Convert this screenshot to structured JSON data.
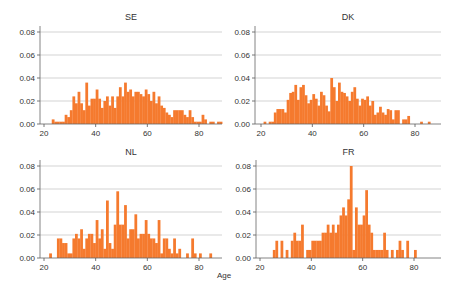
{
  "chart_data": {
    "type": "bar",
    "layout": "2x2 histogram grid",
    "xlabel": "Age",
    "ylabel": "",
    "xlim": [
      18,
      90
    ],
    "ylim": [
      0,
      0.085
    ],
    "x_ticks": [
      20,
      40,
      60,
      80
    ],
    "y_ticks": [
      "0.00",
      "0.02",
      "0.04",
      "0.06",
      "0.08"
    ],
    "grid": "horizontal",
    "bar_color": "#F57A2E",
    "bin_width": 1,
    "bin_start": 20,
    "panels": [
      {
        "title": "SE",
        "values": [
          0,
          0,
          0,
          0.004,
          0.002,
          0.002,
          0.002,
          0.002,
          0.008,
          0.006,
          0.012,
          0.024,
          0.018,
          0.028,
          0.018,
          0.012,
          0.036,
          0.016,
          0.022,
          0.022,
          0.03,
          0.022,
          0.014,
          0.02,
          0.024,
          0.016,
          0.024,
          0.014,
          0.024,
          0.032,
          0.024,
          0.036,
          0.028,
          0.03,
          0.024,
          0.028,
          0.028,
          0.026,
          0.024,
          0.03,
          0.026,
          0.02,
          0.028,
          0.018,
          0.024,
          0.016,
          0.014,
          0.01,
          0.008,
          0.006,
          0.012,
          0.012,
          0.012,
          0.012,
          0.008,
          0.006,
          0.012,
          0.006,
          0.002,
          0.002,
          0.002,
          0.008,
          0.004,
          0.0,
          0.002,
          0.002,
          0.0,
          0.002,
          0.002,
          0.0
        ]
      },
      {
        "title": "DK",
        "values": [
          0,
          0.002,
          0,
          0.002,
          0.002,
          0.01,
          0.013,
          0.013,
          0.013,
          0.01,
          0.021,
          0.027,
          0.028,
          0.034,
          0.021,
          0.032,
          0.034,
          0.025,
          0.018,
          0.021,
          0.026,
          0.022,
          0.016,
          0.028,
          0.025,
          0.016,
          0.011,
          0.04,
          0.032,
          0.02,
          0.036,
          0.028,
          0.027,
          0.024,
          0.02,
          0.028,
          0.032,
          0.022,
          0.016,
          0.022,
          0.021,
          0.024,
          0.016,
          0.02,
          0.008,
          0.01,
          0.015,
          0.01,
          0.008,
          0.013,
          0.012,
          0.004,
          0.012,
          0.012,
          0.0,
          0.004,
          0.004,
          0.007,
          0.0,
          0.0,
          0.0,
          0.0,
          0.002,
          0.0,
          0.0,
          0.002,
          0.0,
          0.0,
          0.0,
          0.0
        ]
      },
      {
        "title": "NL",
        "values": [
          0,
          0,
          0.004,
          0,
          0,
          0.017,
          0.017,
          0.013,
          0.013,
          0.004,
          0.004,
          0.017,
          0.021,
          0.017,
          0.025,
          0.008,
          0.017,
          0.021,
          0.021,
          0.013,
          0.033,
          0.017,
          0.025,
          0.008,
          0.05,
          0.013,
          0.008,
          0.029,
          0.058,
          0.029,
          0.029,
          0.046,
          0.017,
          0.025,
          0.025,
          0.038,
          0.017,
          0.021,
          0.021,
          0.033,
          0.021,
          0.017,
          0.017,
          0.013,
          0.033,
          0.004,
          0.017,
          0.017,
          0.008,
          0.004,
          0.017,
          0.004,
          0.008,
          0.0,
          0.0,
          0.004,
          0.0,
          0.017,
          0.004,
          0.0,
          0.004,
          0.0,
          0.0,
          0.0,
          0.004,
          0,
          0,
          0,
          0,
          0
        ]
      },
      {
        "title": "FR",
        "values": [
          0,
          0,
          0,
          0,
          0,
          0.007,
          0.015,
          0,
          0.015,
          0,
          0.007,
          0,
          0.015,
          0.022,
          0.015,
          0.015,
          0.029,
          0,
          0.007,
          0.007,
          0.015,
          0.015,
          0.015,
          0.015,
          0.022,
          0.022,
          0.029,
          0.022,
          0.029,
          0.022,
          0.029,
          0.037,
          0.044,
          0.037,
          0.051,
          0.08,
          0.007,
          0.044,
          0.029,
          0.029,
          0.037,
          0.059,
          0.029,
          0.022,
          0.007,
          0.007,
          0.007,
          0.007,
          0.022,
          0.007,
          0,
          0.007,
          0,
          0.007,
          0.015,
          0.007,
          0,
          0.015,
          0,
          0,
          0.007,
          0,
          0,
          0,
          0,
          0,
          0,
          0,
          0,
          0
        ]
      }
    ]
  }
}
